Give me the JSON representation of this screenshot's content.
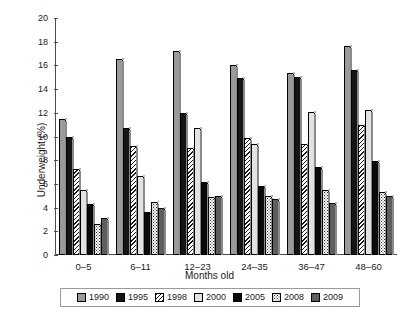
{
  "chart_data": {
    "type": "bar",
    "title": "",
    "xlabel": "Months old",
    "ylabel": "Underweight (%)",
    "categories": [
      "0–5",
      "6–11",
      "12–23",
      "24–35",
      "36–47",
      "48–60"
    ],
    "ylim": [
      0,
      20
    ],
    "yticks": [
      0,
      2,
      4,
      6,
      8,
      10,
      12,
      14,
      16,
      18,
      20
    ],
    "grid": false,
    "legend_position": "bottom",
    "series": [
      {
        "name": "1990",
        "values": [
          11.5,
          16.5,
          17.2,
          16.0,
          15.4,
          17.6
        ],
        "fill": "solid",
        "color": "#9a9a9a"
      },
      {
        "name": "1995",
        "values": [
          10.0,
          10.7,
          12.0,
          14.9,
          15.0,
          15.6
        ],
        "fill": "solid",
        "color": "#151515"
      },
      {
        "name": "1998",
        "values": [
          7.3,
          9.2,
          9.0,
          9.9,
          9.4,
          11.0
        ],
        "fill": "diagonal-hatch",
        "color": "#1a1a1a"
      },
      {
        "name": "2000",
        "values": [
          5.5,
          6.7,
          10.7,
          9.4,
          12.1,
          12.2
        ],
        "fill": "solid",
        "color": "#e2e2e2"
      },
      {
        "name": "2005",
        "values": [
          4.3,
          3.6,
          6.2,
          5.8,
          7.4,
          7.9
        ],
        "fill": "solid",
        "color": "#0a0a0a"
      },
      {
        "name": "2008",
        "values": [
          2.6,
          4.5,
          4.9,
          5.0,
          5.5,
          5.3
        ],
        "fill": "dotted",
        "color": "#2a2a2a"
      },
      {
        "name": "2009",
        "values": [
          3.1,
          4.0,
          5.0,
          4.7,
          4.4,
          5.0
        ],
        "fill": "solid",
        "color": "#5e5e5e"
      }
    ]
  }
}
